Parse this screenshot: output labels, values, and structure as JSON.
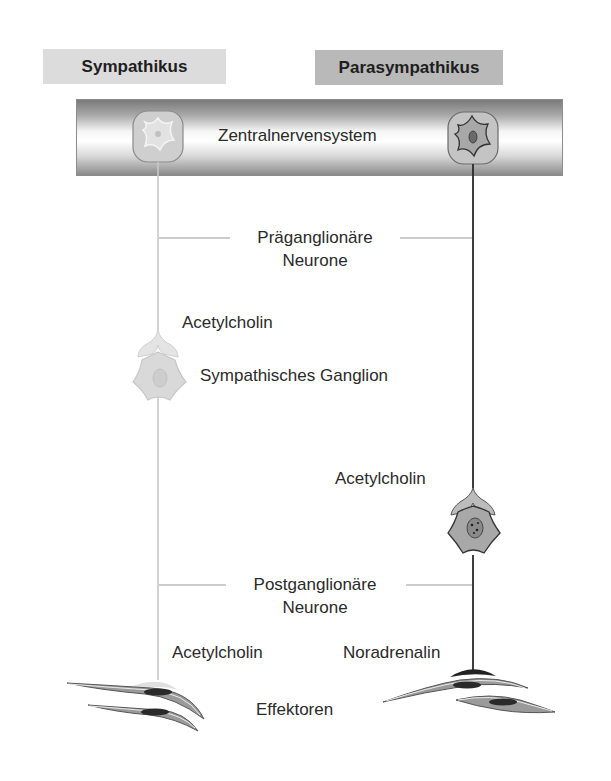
{
  "headers": {
    "sympathetic": "Sympathikus",
    "parasympathetic": "Parasympathikus"
  },
  "cns": {
    "label": "Zentralnervensystem"
  },
  "labels": {
    "preganglionic_line1": "Präganglionäre",
    "preganglionic_line2": "Neurone",
    "sym_ganglion_transmitter": "Acetylcholin",
    "sym_ganglion": "Sympathisches Ganglion",
    "para_ganglion_transmitter": "Acetylcholin",
    "postganglionic_line1": "Postganglionäre",
    "postganglionic_line2": "Neurone",
    "sym_effector_transmitter": "Acetylcholin",
    "para_effector_transmitter": "Noradrenalin",
    "effectors": "Effektoren"
  },
  "colors": {
    "sympathetic_header": "#dcdcdc",
    "parasympathetic_header": "#b9b9b9",
    "sympathetic_neuron_line": "#c8c8c8",
    "parasympathetic_neuron_line": "#2a2a2a",
    "ganglion_cell_light": "#d9d9d9",
    "ganglion_cell_dark": "#a9a9a9",
    "effector_cell": "#9a9a9a"
  }
}
